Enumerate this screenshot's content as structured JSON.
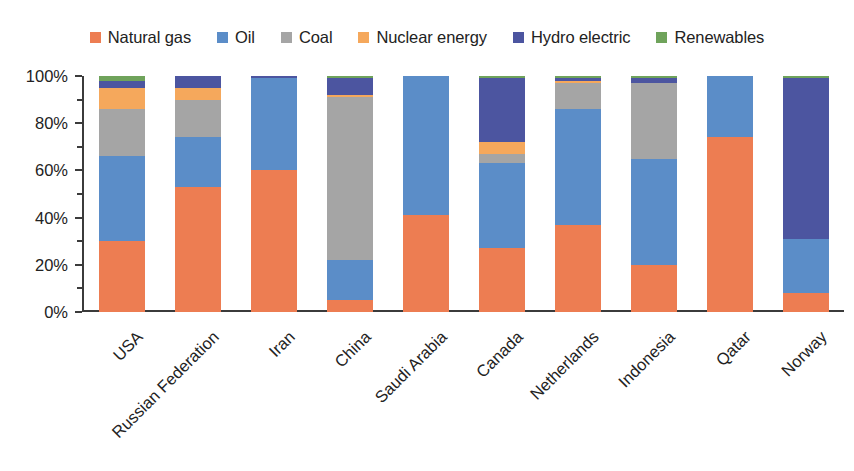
{
  "chart_data": {
    "type": "bar",
    "subtype": "stacked-percentage",
    "title": "",
    "xlabel": "",
    "ylabel": "",
    "ylim": [
      0,
      100
    ],
    "ytick_labels": [
      "0%",
      "20%",
      "40%",
      "60%",
      "80%",
      "100%"
    ],
    "ytick_values": [
      0,
      20,
      40,
      60,
      80,
      100
    ],
    "yminor_values": [
      10,
      30,
      50,
      70,
      90
    ],
    "grid": false,
    "legend_position": "top",
    "value_unit": "%",
    "categories": [
      "USA",
      "Russian Federation",
      "Iran",
      "China",
      "Saudi Arabia",
      "Canada",
      "Netherlands",
      "Indonesia",
      "Qatar",
      "Norway"
    ],
    "series": [
      {
        "name": "Natural gas",
        "color": "#ED7D52",
        "values": [
          30,
          53,
          60,
          5,
          41,
          27,
          37,
          20,
          74,
          8
        ]
      },
      {
        "name": "Oil",
        "color": "#5B8DC8",
        "values": [
          36,
          21,
          39,
          17,
          59,
          36,
          49,
          45,
          26,
          23
        ]
      },
      {
        "name": "Coal",
        "color": "#A5A5A5",
        "values": [
          20,
          16,
          0,
          69,
          0,
          4,
          11,
          32,
          0,
          0
        ]
      },
      {
        "name": "Nuclear energy",
        "color": "#F5A85C",
        "values": [
          9,
          5,
          0,
          1,
          0,
          5,
          1,
          0,
          0,
          0
        ]
      },
      {
        "name": "Hydro electric",
        "color": "#4C55A0",
        "values": [
          3,
          5,
          1,
          7,
          0,
          27,
          1,
          2,
          0,
          68
        ]
      },
      {
        "name": "Renewables",
        "color": "#6FA35B",
        "values": [
          2,
          0,
          0,
          1,
          0,
          1,
          1,
          1,
          0,
          1
        ]
      }
    ]
  },
  "legend": {
    "items": [
      {
        "label": "Natural gas",
        "color": "#ED7D52"
      },
      {
        "label": "Oil",
        "color": "#5B8DC8"
      },
      {
        "label": "Coal",
        "color": "#A5A5A5"
      },
      {
        "label": "Nuclear energy",
        "color": "#F5A85C"
      },
      {
        "label": "Hydro electric",
        "color": "#4C55A0"
      },
      {
        "label": "Renewables",
        "color": "#6FA35B"
      }
    ]
  },
  "axis": {
    "axis_color": "#3b3b3b",
    "text_color": "#222222"
  }
}
